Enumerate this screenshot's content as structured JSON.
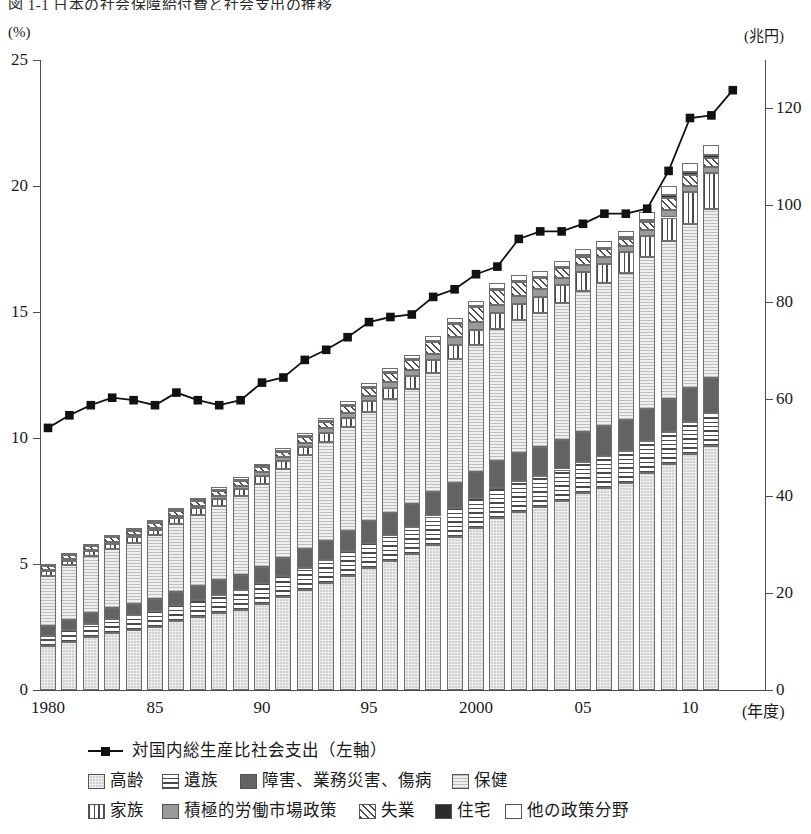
{
  "title": "図 1-1  日本の社会保障給付費と社会支出の推移",
  "axes": {
    "left_unit": "(%)",
    "right_unit": "(兆円)",
    "x_unit": "(年度)",
    "left_ticks": [
      "0",
      "5",
      "10",
      "15",
      "20",
      "25"
    ],
    "right_ticks": [
      "0",
      "20",
      "40",
      "60",
      "80",
      "100",
      "120"
    ],
    "x_ticks": [
      "1980",
      "85",
      "90",
      "95",
      "2000",
      "05",
      "10"
    ],
    "left_range": [
      0,
      25
    ],
    "right_range": [
      0,
      130
    ]
  },
  "legend": {
    "line_label": "対国内総生産比社会支出（左軸）",
    "items": [
      {
        "key": "kourei",
        "label": "高齢"
      },
      {
        "key": "izoku",
        "label": "遺族"
      },
      {
        "key": "shogai",
        "label": "障害、業務災害、傷病"
      },
      {
        "key": "hoken",
        "label": "保健"
      },
      {
        "key": "kazoku",
        "label": "家族"
      },
      {
        "key": "roudou",
        "label": "積極的労働市場政策"
      },
      {
        "key": "shitsugyo",
        "label": "失業"
      },
      {
        "key": "jutaku",
        "label": "住宅"
      },
      {
        "key": "tano",
        "label": "他の政策分野"
      }
    ]
  },
  "chart_data": {
    "type": "bar",
    "xlabel": "(年度)",
    "ylabel": "(%)",
    "y2label": "(兆円)",
    "ylim": [
      0,
      25
    ],
    "y2lim": [
      0,
      130
    ],
    "grid": false,
    "legend_position": "bottom",
    "categories": [
      "1980",
      "1981",
      "1982",
      "1983",
      "1984",
      "1985",
      "1986",
      "1987",
      "1988",
      "1989",
      "1990",
      "1991",
      "1992",
      "1993",
      "1994",
      "1995",
      "1996",
      "1997",
      "1998",
      "1999",
      "2000",
      "2001",
      "2002",
      "2003",
      "2004",
      "2005",
      "2006",
      "2007",
      "2008",
      "2009",
      "2010",
      "2011"
    ],
    "stacked_unit": "兆円",
    "series": [
      {
        "name": "高齢",
        "values": [
          9.0,
          10.0,
          11.0,
          11.8,
          12.4,
          13.0,
          14.2,
          15.0,
          15.8,
          16.6,
          17.8,
          19.2,
          20.6,
          22.0,
          23.6,
          25.2,
          26.6,
          28.0,
          30.0,
          31.6,
          33.4,
          35.4,
          36.8,
          37.8,
          39.0,
          40.6,
          41.6,
          42.8,
          44.8,
          46.6,
          48.6,
          50.4
        ]
      },
      {
        "name": "遺族",
        "values": [
          2.2,
          2.4,
          2.6,
          2.8,
          3.0,
          3.2,
          3.4,
          3.6,
          3.8,
          4.0,
          4.2,
          4.4,
          4.6,
          4.8,
          5.0,
          5.2,
          5.4,
          5.6,
          5.8,
          6.0,
          6.2,
          6.3,
          6.4,
          6.4,
          6.5,
          6.5,
          6.6,
          6.6,
          6.6,
          6.7,
          6.7,
          6.7
        ]
      },
      {
        "name": "障害、業務災害、傷病",
        "values": [
          2.0,
          2.1,
          2.2,
          2.3,
          2.4,
          2.5,
          2.6,
          2.8,
          3.0,
          3.2,
          3.4,
          3.6,
          3.8,
          4.0,
          4.2,
          4.4,
          4.6,
          4.8,
          5.0,
          5.2,
          5.4,
          5.6,
          5.8,
          5.9,
          6.0,
          6.1,
          6.2,
          6.3,
          6.5,
          6.8,
          7.0,
          7.2
        ]
      },
      {
        "name": "保健",
        "values": [
          10.4,
          11.2,
          11.8,
          12.2,
          12.6,
          13.2,
          14.0,
          14.8,
          15.4,
          16.2,
          17.2,
          18.4,
          19.4,
          20.4,
          21.4,
          22.6,
          23.4,
          23.8,
          24.6,
          25.6,
          26.2,
          27.2,
          27.4,
          27.6,
          28.4,
          29.2,
          29.6,
          30.4,
          31.4,
          32.6,
          33.8,
          35.0
        ]
      },
      {
        "name": "家族",
        "values": [
          0.9,
          1.0,
          1.0,
          1.1,
          1.1,
          1.2,
          1.3,
          1.3,
          1.4,
          1.5,
          1.6,
          1.7,
          1.8,
          1.9,
          2.0,
          2.2,
          2.4,
          2.5,
          2.6,
          2.8,
          3.0,
          3.2,
          3.3,
          3.4,
          3.6,
          3.8,
          4.0,
          4.2,
          4.4,
          4.8,
          6.6,
          7.4
        ]
      },
      {
        "name": "積極的労働市場政策",
        "values": [
          0.3,
          0.3,
          0.3,
          0.4,
          0.4,
          0.4,
          0.5,
          0.5,
          0.6,
          0.6,
          0.7,
          0.7,
          0.8,
          0.9,
          1.0,
          1.1,
          1.2,
          1.3,
          1.4,
          1.6,
          1.8,
          1.8,
          1.7,
          1.6,
          1.5,
          1.4,
          1.3,
          1.3,
          1.3,
          1.5,
          1.4,
          1.3
        ]
      },
      {
        "name": "失業",
        "values": [
          0.8,
          0.9,
          0.9,
          1.0,
          1.0,
          1.0,
          1.1,
          1.2,
          1.2,
          1.2,
          1.2,
          1.2,
          1.3,
          1.4,
          1.6,
          1.8,
          2.0,
          2.1,
          2.4,
          2.8,
          3.0,
          3.0,
          2.8,
          2.4,
          2.0,
          1.8,
          1.6,
          1.5,
          1.6,
          2.6,
          2.2,
          1.8
        ]
      },
      {
        "name": "住宅",
        "values": [
          0.1,
          0.1,
          0.1,
          0.1,
          0.1,
          0.1,
          0.1,
          0.1,
          0.1,
          0.1,
          0.1,
          0.1,
          0.1,
          0.1,
          0.1,
          0.1,
          0.1,
          0.1,
          0.2,
          0.2,
          0.2,
          0.2,
          0.2,
          0.2,
          0.2,
          0.3,
          0.3,
          0.3,
          0.4,
          0.5,
          0.5,
          0.6
        ]
      },
      {
        "name": "他の政策分野",
        "values": [
          0.3,
          0.3,
          0.3,
          0.3,
          0.4,
          0.4,
          0.4,
          0.4,
          0.5,
          0.5,
          0.5,
          0.6,
          0.6,
          0.7,
          0.7,
          0.8,
          0.8,
          0.9,
          1.0,
          1.0,
          1.1,
          1.2,
          1.2,
          1.2,
          1.3,
          1.3,
          1.4,
          1.4,
          1.6,
          1.8,
          1.9,
          2.0
        ]
      }
    ],
    "line": {
      "name": "対国内総生産比社会支出（左軸）",
      "axis": "left",
      "unit": "%",
      "values": [
        10.4,
        10.9,
        11.3,
        11.6,
        11.5,
        11.3,
        11.8,
        11.5,
        11.3,
        11.5,
        12.2,
        12.4,
        13.1,
        13.5,
        14.0,
        14.6,
        14.8,
        14.9,
        15.6,
        15.9,
        16.5,
        16.8,
        17.9,
        18.2,
        18.2,
        18.5,
        18.9,
        18.9,
        19.1,
        20.6,
        22.7,
        22.8,
        23.8
      ]
    }
  }
}
